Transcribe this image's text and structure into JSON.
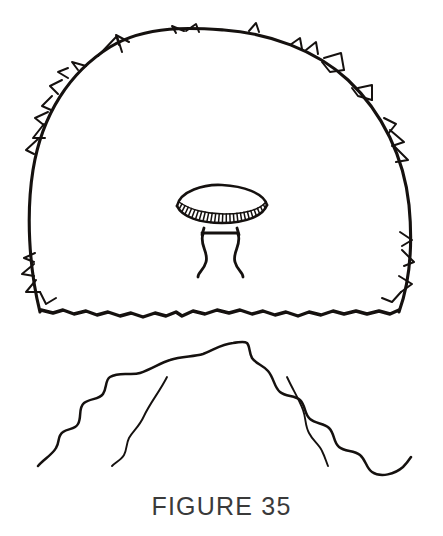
{
  "figure": {
    "caption": "FIGURE 35",
    "caption_color": "#3a3a3a",
    "background_color": "#ffffff",
    "ink_color": "#15110f",
    "medium": "black ink line drawing"
  },
  "illustration": {
    "title": "ufo-under-dome-over-mountains",
    "elements": [
      {
        "name": "dome-outline",
        "description": "large rounded dome / hemispherical field with ragged spiked outer edge",
        "bounds": {
          "x": 26,
          "y": 28,
          "width": 388,
          "height": 292
        }
      },
      {
        "name": "dome-base-line",
        "description": "wavy bumpy horizontal line closing the bottom of the dome",
        "bounds": {
          "x": 40,
          "y": 304,
          "width": 360,
          "height": 14
        }
      },
      {
        "name": "flying-saucer",
        "description": "disc shaped craft with smooth upper dome and ribbed lower rim",
        "bounds": {
          "x": 176,
          "y": 186,
          "width": 92,
          "height": 36
        }
      },
      {
        "name": "landing-gear",
        "description": "two curved landing legs joined by a horizontal crossbar",
        "bounds": {
          "x": 196,
          "y": 228,
          "width": 46,
          "height": 50
        }
      },
      {
        "name": "mountain-ridge",
        "description": "jagged mountain silhouette with a central peak and stepped slopes falling left and right",
        "bounds": {
          "x": 38,
          "y": 341,
          "width": 374,
          "height": 126
        }
      },
      {
        "name": "ridge-inner-left",
        "description": "inner descending fold line on the left slope",
        "bounds": {
          "x": 107,
          "y": 377,
          "width": 60,
          "height": 90
        }
      },
      {
        "name": "ridge-inner-right",
        "description": "inner descending fold line on the right slope",
        "bounds": {
          "x": 287,
          "y": 377,
          "width": 44,
          "height": 90
        }
      }
    ],
    "saucer_rib_count": 26
  },
  "paths": {
    "dome_main": "M 40 312 C 29 268 26 214 33 170 C 42 114 70 72 110 47 C 148 24 196 28 224 30 C 268 33 316 50 348 80 C 383 113 404 158 409 205 C 413 246 409 284 399 312",
    "dome_base": "M 41 310 L 53 313 L 63 310 L 74 314 L 86 311 L 97 315 L 108 312 L 120 316 L 131 313 L 143 317 L 155 313 L 166 316 L 176 312 L 182 316 L 193 311 L 205 314 L 217 310 L 229 313 L 240 310 L 252 314 L 263 311 L 275 315 L 286 312 L 298 316 L 309 312 L 321 315 L 333 311 L 344 314 L 356 311 L 367 314 L 379 311 L 390 314 L 399 310",
    "spikes": [
      "M 176 33 L 172 26 L 184 31",
      "M 186 31 L 196 24 L 199 32",
      "M 249 31 L 256 23 L 259 32",
      "M 119 45 L 116 35 L 129 42",
      "M 98 56 L 117 36 L 122 52",
      "M 290 45 L 300 38 L 302 49",
      "M 306 50 L 316 42 L 318 54",
      "M 78 70 L 72 62 L 86 66",
      "M 68 78 L 58 72 L 68 68",
      "M 62 80 L 50 86 L 58 94",
      "M 324 58 L 341 53 L 344 70",
      "M 344 70 L 330 72 L 322 62",
      "M 358 88 L 372 85 L 372 100",
      "M 372 100 L 358 96 L 352 88",
      "M 52 96 L 42 106 L 51 110",
      "M 48 112 L 35 118 L 45 126",
      "M 44 124 L 33 138 L 45 138",
      "M 38 139 L 26 150 L 34 154",
      "M 384 118 L 396 124 L 388 134",
      "M 390 130 L 404 142 L 392 146",
      "M 394 146 L 408 160 L 396 162",
      "M 35 253 L 24 258 L 34 262",
      "M 34 264 L 22 274 L 34 276",
      "M 400 232 L 412 240 L 402 246",
      "M 402 250 L 414 262 L 404 266",
      "M 36 280 L 26 292 L 40 292",
      "M 40 292 L 46 304 L 56 298",
      "M 399 276 L 412 284 L 401 292",
      "M 401 292 L 392 302 L 382 298"
    ],
    "saucer_top": "M 177 206 C 180 191 204 184 222 185 C 243 186 264 193 267 205",
    "saucer_bottom": "M 177 206 C 182 217 200 223 222 223 C 246 223 263 216 267 205",
    "saucer_rim": "M 179 202 C 190 210 208 214 224 214 C 243 214 259 210 266 202",
    "saucer_legs_bar": "M 202 233 L 238 233",
    "saucer_leg_left_top": "M 204 228 L 202 235",
    "saucer_leg_right_top": "M 237 228 L 239 235",
    "saucer_leg_left": "M 203 234 C 199 245 209 252 206 262 C 204 270 198 272 198 277",
    "saucer_leg_right": "M 238 234 C 242 245 232 252 235 262 C 237 270 243 272 243 277",
    "ridge_main": "M 38 466 C 44 459 52 455 56 448 C 60 442 57 436 63 432 C 68 428 75 430 78 424 C 82 417 78 408 84 403 C 90 398 99 400 103 394 C 107 388 105 380 110 377 C 120 371 131 376 140 373 C 152 369 160 363 170 360 C 182 356 193 357 203 354 C 214 350 221 344 233 343 C 242 342 244 341 247 343 C 250 346 249 353 252 358 C 256 364 263 365 268 371 C 274 378 274 387 280 392 C 286 397 295 395 300 400 C 306 406 304 414 310 419 C 316 424 324 423 329 428 C 335 434 333 442 339 447 C 345 452 354 450 360 455 C 366 460 366 468 372 472 C 381 478 395 474 403 467 C 407 463 409 460 411 457",
    "ridge_inner_left": "M 167 377 C 160 391 150 403 144 416 C 139 427 133 431 129 438 C 126 444 127 450 124 455 C 121 460 116 462 112 466",
    "ridge_inner_right": "M 287 377 C 293 390 299 399 303 410 C 306 418 305 426 309 433 C 313 441 319 444 322 451 C 325 457 326 461 328 466"
  }
}
